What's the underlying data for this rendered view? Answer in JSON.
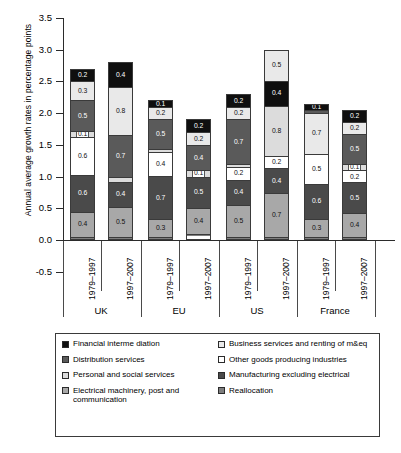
{
  "chart_data": {
    "type": "bar",
    "subtype": "stacked-bar-grouped",
    "title": "",
    "xlabel": "",
    "ylabel": "Annual average growth rates in percentage points",
    "ylim": [
      -0.5,
      3.5
    ],
    "ytick_labels": [
      "3.5",
      "3.0",
      "2.5",
      "2.0",
      "1.5",
      "1.0",
      "0.5",
      "0.0",
      "-0.5"
    ],
    "ytick_values": [
      3.5,
      3.0,
      2.5,
      2.0,
      1.5,
      1.0,
      0.5,
      0.0,
      -0.5
    ],
    "grid": false,
    "legend_position": "bottom",
    "groups": [
      "UK",
      "EU",
      "US",
      "France"
    ],
    "periods": [
      "1979–1997",
      "1997–2007"
    ],
    "categories": [
      "Financial interme diation",
      "Business services and renting of m&eq",
      "Distribution services",
      "Other goods producing industries",
      "Personal and social services",
      "Manufacturing excluding electrical",
      "Electrical machinery, post and communication",
      "Reallocation"
    ],
    "category_keys": [
      "fin",
      "bus",
      "dist",
      "ogp",
      "pers",
      "manu",
      "elec",
      "real"
    ],
    "bars": [
      {
        "group": "UK",
        "period": "1979–1997",
        "total": 2.7,
        "segments": [
          {
            "key": "fin",
            "value": 0.2,
            "label": "0.2"
          },
          {
            "key": "bus",
            "value": 0.3,
            "label": "0.3"
          },
          {
            "key": "dist",
            "value": 0.5,
            "label": "0.5"
          },
          {
            "key": "pers",
            "value": 0.1,
            "label": "0.1"
          },
          {
            "key": "ogp",
            "value": 0.6,
            "label": "0.6"
          },
          {
            "key": "manu",
            "value": 0.6,
            "label": "0.6"
          },
          {
            "key": "elec",
            "value": 0.4,
            "label": "0.4"
          },
          {
            "key": "real",
            "value": 0.02,
            "label": "0.02"
          }
        ]
      },
      {
        "group": "UK",
        "period": "1997–2007",
        "total": 2.8,
        "segments": [
          {
            "key": "fin",
            "value": 0.4,
            "label": "0.4"
          },
          {
            "key": "bus",
            "value": 0.8,
            "label": "0.8"
          },
          {
            "key": "dist",
            "value": 0.7,
            "label": "0.7"
          },
          {
            "key": "pers",
            "value": 0.08,
            "label": "0.08"
          },
          {
            "key": "manu",
            "value": 0.4,
            "label": "0.4"
          },
          {
            "key": "elec",
            "value": 0.5,
            "label": "0.5"
          },
          {
            "key": "real",
            "value": 0.02,
            "label": "0.02"
          }
        ]
      },
      {
        "group": "EU",
        "period": "1979–1997",
        "total": 2.2,
        "segments": [
          {
            "key": "fin",
            "value": 0.1,
            "label": "0.1"
          },
          {
            "key": "bus",
            "value": 0.2,
            "label": "0.2"
          },
          {
            "key": "dist",
            "value": 0.5,
            "label": "0.5"
          },
          {
            "key": "pers",
            "value": 0.05,
            "label": "0.05"
          },
          {
            "key": "ogp",
            "value": 0.4,
            "label": "0.4"
          },
          {
            "key": "manu",
            "value": 0.7,
            "label": "0.7"
          },
          {
            "key": "elec",
            "value": 0.3,
            "label": "0.3"
          },
          {
            "key": "real",
            "value": 0.02,
            "label": "0.02"
          }
        ]
      },
      {
        "group": "EU",
        "period": "1997–2007",
        "total": 1.9,
        "segments": [
          {
            "key": "fin",
            "value": 0.2,
            "label": "0.2"
          },
          {
            "key": "bus",
            "value": 0.2,
            "label": "0.2"
          },
          {
            "key": "dist",
            "value": 0.4,
            "label": "0.4"
          },
          {
            "key": "pers",
            "value": 0.1,
            "label": "0.1"
          },
          {
            "key": "manu",
            "value": 0.5,
            "label": "0.5"
          },
          {
            "key": "elec",
            "value": 0.4,
            "label": "0.4"
          },
          {
            "key": "real",
            "value": 0.02,
            "label": "0.02"
          }
        ]
      },
      {
        "group": "US",
        "period": "1979–1997",
        "total": 2.3,
        "segments": [
          {
            "key": "fin",
            "value": 0.2,
            "label": "0.2"
          },
          {
            "key": "bus",
            "value": 0.2,
            "label": "0.2"
          },
          {
            "key": "dist",
            "value": 0.7,
            "label": "0.7"
          },
          {
            "key": "pers",
            "value": 0.05,
            "label": "0.05"
          },
          {
            "key": "ogp",
            "value": 0.2,
            "label": "0.2"
          },
          {
            "key": "manu",
            "value": 0.4,
            "label": "0.4"
          },
          {
            "key": "elec",
            "value": 0.5,
            "label": "0.5"
          },
          {
            "key": "real",
            "value": 0.02,
            "label": "0.02"
          }
        ]
      },
      {
        "group": "US",
        "period": "1997–2007",
        "total": 3.0,
        "segments": [
          {
            "key": "bus",
            "value": 0.5,
            "label": "0.5"
          },
          {
            "key": "fin",
            "value": 0.4,
            "label": "0.4"
          },
          {
            "key": "pers",
            "value": 0.8,
            "label": "0.8"
          },
          {
            "key": "ogp",
            "value": 0.2,
            "label": "0.2"
          },
          {
            "key": "manu",
            "value": 0.4,
            "label": "0.4"
          },
          {
            "key": "elec",
            "value": 0.7,
            "label": "0.7"
          },
          {
            "key": "real",
            "value": 0.02,
            "label": "0.02"
          }
        ]
      },
      {
        "group": "France",
        "period": "1979–1997",
        "total": 2.15,
        "segments": [
          {
            "key": "fin",
            "value": 0.1,
            "label": "0.1"
          },
          {
            "key": "dist",
            "value": 0.05,
            "label": "0.05"
          },
          {
            "key": "bus",
            "value": 0.7,
            "label": "0.7"
          },
          {
            "key": "ogp",
            "value": 0.5,
            "label": "0.5"
          },
          {
            "key": "manu",
            "value": 0.6,
            "label": "0.6"
          },
          {
            "key": "elec",
            "value": 0.3,
            "label": "0.3"
          },
          {
            "key": "real",
            "value": 0.02,
            "label": "0.02"
          }
        ]
      },
      {
        "group": "France",
        "period": "1997–2007",
        "total": 2.05,
        "segments": [
          {
            "key": "fin",
            "value": 0.2,
            "label": "0.2"
          },
          {
            "key": "bus",
            "value": 0.2,
            "label": "0.2"
          },
          {
            "key": "dist",
            "value": 0.5,
            "label": "0.5"
          },
          {
            "key": "pers",
            "value": 0.1,
            "label": "0.1"
          },
          {
            "key": "ogp",
            "value": 0.2,
            "label": "0.2"
          },
          {
            "key": "manu",
            "value": 0.5,
            "label": "0.5"
          },
          {
            "key": "elec",
            "value": 0.4,
            "label": "0.4"
          },
          {
            "key": "real",
            "value": 0.02,
            "label": "0.02"
          }
        ]
      }
    ]
  },
  "legend": {
    "left_items": [
      {
        "key": "fin",
        "label": "Financial interme diation"
      },
      {
        "key": "dist",
        "label": "Distribution services"
      },
      {
        "key": "pers",
        "label": "Personal and social services"
      },
      {
        "key": "elec",
        "label": "Electrical machinery, post and communication"
      }
    ],
    "right_items": [
      {
        "key": "bus",
        "label": "Business services and renting of m&eq"
      },
      {
        "key": "ogp",
        "label": "Other goods producing industries"
      },
      {
        "key": "manu",
        "label": "Manufacturing excluding electrical"
      },
      {
        "key": "real",
        "label": "Reallocation"
      }
    ]
  },
  "colors": {
    "fin": "#0f0f0f",
    "bus": "#e9e9e9",
    "dist": "#5a5a5a",
    "ogp": "#ffffff",
    "pers": "#dcdcdc",
    "manu": "#4a4a4a",
    "elec": "#a8a8a8",
    "real": "#7e7e7e",
    "axis": "#2b2b2b"
  }
}
